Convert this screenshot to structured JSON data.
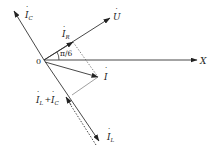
{
  "diagram": {
    "type": "phasor-diagram",
    "origin_label": "0",
    "axis_label": "X",
    "angle_label": "π/6",
    "phasors": {
      "U": {
        "label": "U",
        "dot": "˙"
      },
      "I_R": {
        "label": "I",
        "sub": "R"
      },
      "I": {
        "label": "I"
      },
      "I_C": {
        "label": "I",
        "sub": "C"
      },
      "I_L": {
        "label": "I",
        "sub": "L"
      },
      "I_L_plus_I_C": {
        "label1": "I",
        "sub1": "L",
        "plus": "+",
        "label2": "I",
        "sub2": "C"
      }
    },
    "colors": {
      "line": "#333333",
      "background": "#ffffff"
    }
  }
}
